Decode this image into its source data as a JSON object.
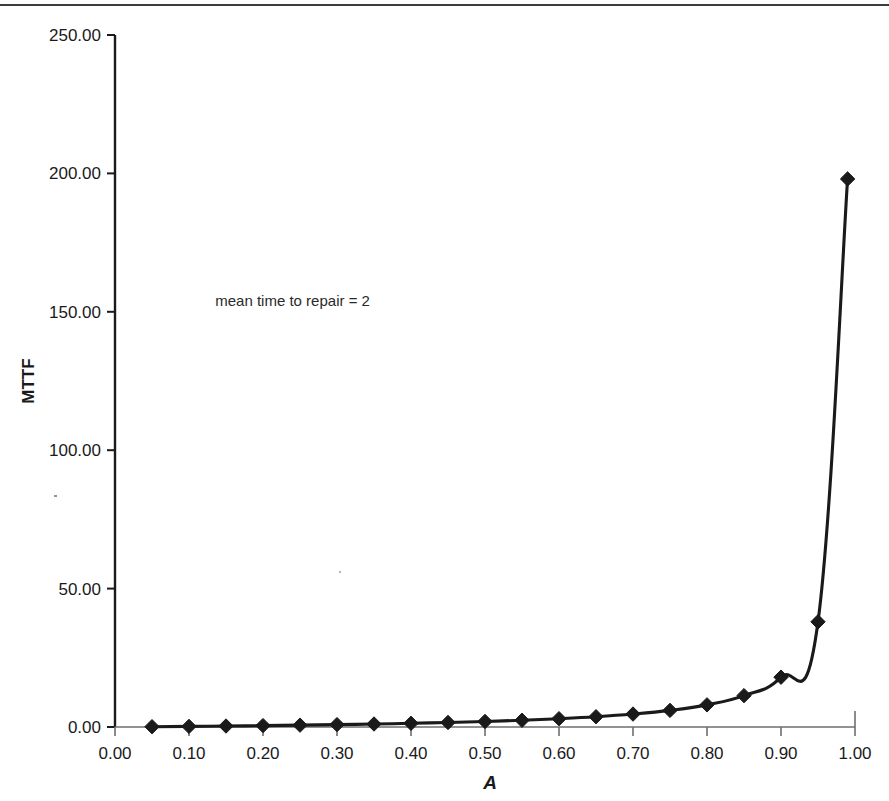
{
  "figure": {
    "name": "mttf-vs-availability-chart",
    "background_color": "#ffffff",
    "ink_color": "#1a1a1a"
  },
  "annotations": [
    {
      "id": "mttr-note",
      "text": "mean time to repair = 2",
      "x_data": 0.24,
      "y_data": 152
    }
  ],
  "axes": {
    "x": {
      "label": "A",
      "tick_labels": [
        "0.00",
        "0.10",
        "0.20",
        "0.30",
        "0.40",
        "0.50",
        "0.60",
        "0.70",
        "0.80",
        "0.90",
        "1.00"
      ],
      "tick_values": [
        0.0,
        0.1,
        0.2,
        0.3,
        0.4,
        0.5,
        0.6,
        0.7,
        0.8,
        0.9,
        1.0
      ],
      "min": 0.0,
      "max": 1.0
    },
    "y": {
      "label": "MTTF",
      "tick_labels": [
        "0.00",
        "50.00",
        "100.00",
        "150.00",
        "200.00",
        "250.00"
      ],
      "tick_values": [
        0,
        50,
        100,
        150,
        200,
        250
      ],
      "min": 0,
      "max": 250
    }
  },
  "chart_data": {
    "type": "line",
    "title": "",
    "subtitle": "",
    "xlabel": "A",
    "ylabel": "MTTF",
    "xlim": [
      0.0,
      1.0
    ],
    "ylim": [
      0,
      250
    ],
    "grid": false,
    "legend": false,
    "legend_position": "none",
    "annotations": [
      "mean time to repair = 2"
    ],
    "marker": "diamond",
    "line_color": "#1a1a1a",
    "marker_color": "#1a1a1a",
    "series": [
      {
        "name": "MTTF",
        "x": [
          0.05,
          0.1,
          0.15,
          0.2,
          0.25,
          0.3,
          0.35,
          0.4,
          0.45,
          0.5,
          0.55,
          0.6,
          0.65,
          0.7,
          0.75,
          0.8,
          0.85,
          0.9,
          0.95,
          0.99
        ],
        "values": [
          0.11,
          0.22,
          0.35,
          0.5,
          0.67,
          0.86,
          1.08,
          1.33,
          1.64,
          2.0,
          2.44,
          3.0,
          3.71,
          4.67,
          6.0,
          8.0,
          11.33,
          18.0,
          38.0,
          198.0
        ]
      }
    ]
  }
}
